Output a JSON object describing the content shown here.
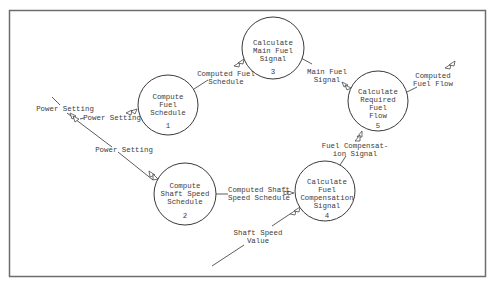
{
  "diagram": {
    "type": "data-flow-diagram",
    "colors": {
      "line": "#4a4a4a",
      "frame": "#6d6d6d",
      "text": "#3c3c3c",
      "background": "#ffffff"
    },
    "processes": [
      {
        "id": "1",
        "lines": [
          "Compute",
          "Fuel",
          "Schedule"
        ],
        "number": "1"
      },
      {
        "id": "2",
        "lines": [
          "Compute",
          "Shaft Speed",
          "Schedule"
        ],
        "number": "2"
      },
      {
        "id": "3",
        "lines": [
          "Calculate",
          "Main Fuel",
          "Signal"
        ],
        "number": "3"
      },
      {
        "id": "4",
        "lines": [
          "Calculate",
          "Fuel",
          "Compensation",
          "Signal"
        ],
        "number": "4"
      },
      {
        "id": "5",
        "lines": [
          "Calculate",
          "Required",
          "Fuel",
          "Flow"
        ],
        "number": "5"
      }
    ],
    "flows": [
      {
        "id": "power-setting-in",
        "lines": [
          "Power Setting"
        ]
      },
      {
        "id": "power-setting-to-1",
        "lines": [
          "Power Setting"
        ]
      },
      {
        "id": "power-setting-to-2",
        "lines": [
          "Power Setting"
        ]
      },
      {
        "id": "computed-fuel-schedule",
        "lines": [
          "Computed Fuel",
          "Schedule"
        ]
      },
      {
        "id": "main-fuel-signal",
        "lines": [
          "Main Fuel",
          "Signal"
        ]
      },
      {
        "id": "computed-fuel-flow",
        "lines": [
          "Computed",
          "Fuel Flow"
        ]
      },
      {
        "id": "fuel-compensation-signal",
        "lines": [
          "Fuel Compensat-",
          "ion Signal"
        ]
      },
      {
        "id": "computed-shaft-speed-schedule",
        "lines": [
          "Computed Shaft",
          "Speed Schedule"
        ]
      },
      {
        "id": "shaft-speed-value",
        "lines": [
          "Shaft Speed",
          "Value"
        ]
      }
    ]
  }
}
